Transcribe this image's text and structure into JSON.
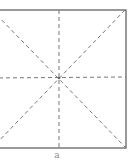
{
  "diagram": {
    "type": "fold-lines-square",
    "caption": "a",
    "colors": {
      "border": "#555555",
      "crease": "#777777",
      "background": "#ffffff"
    },
    "square": {
      "left": -8,
      "top": 10,
      "right": 126,
      "bottom": 148
    },
    "center": {
      "x": 59,
      "y": 78
    },
    "lines": [
      {
        "name": "vertical-crease",
        "style": "dashed"
      },
      {
        "name": "horizontal-crease",
        "style": "dashed"
      },
      {
        "name": "diagonal-crease-tl-br",
        "style": "dashed"
      },
      {
        "name": "diagonal-crease-tr-bl",
        "style": "dashed"
      }
    ]
  }
}
